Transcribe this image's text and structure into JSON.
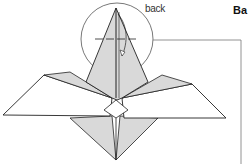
{
  "diagram": {
    "annotation": "back",
    "heading_fragment": "Ba",
    "colors": {
      "fill_shaded": "#d9d9d9",
      "stroke": "#222222",
      "background": "#ffffff"
    }
  }
}
